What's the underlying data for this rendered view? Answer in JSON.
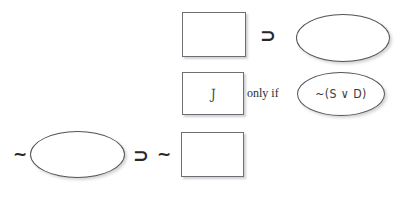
{
  "diagram": {
    "stroke_color": "#54545a",
    "rect_border_color": "#6e6e74",
    "text_color": "#2e2e33",
    "background": "#ffffff",
    "rows": [
      {
        "id": "row-1",
        "elements": [
          {
            "kind": "rect",
            "name": "blank-box-1",
            "text": ""
          },
          {
            "kind": "operator",
            "name": "horseshoe-1",
            "text": "⊃"
          },
          {
            "kind": "ellipse",
            "name": "blank-ellipse-1",
            "text": ""
          }
        ]
      },
      {
        "id": "row-2",
        "elements": [
          {
            "kind": "rect",
            "name": "box-with-j",
            "text": "J"
          },
          {
            "kind": "printed",
            "name": "only-if-connective",
            "text": "only if"
          },
          {
            "kind": "ellipse",
            "name": "ellipse-formula",
            "text": "~(S ∨ D)"
          }
        ]
      },
      {
        "id": "row-3",
        "elements": [
          {
            "kind": "operator",
            "name": "tilde-1",
            "text": "~"
          },
          {
            "kind": "ellipse",
            "name": "blank-ellipse-2",
            "text": ""
          },
          {
            "kind": "operator",
            "name": "horseshoe-2",
            "text": "⊃"
          },
          {
            "kind": "operator",
            "name": "tilde-2",
            "text": "~"
          },
          {
            "kind": "rect",
            "name": "blank-box-2",
            "text": ""
          }
        ]
      }
    ]
  }
}
